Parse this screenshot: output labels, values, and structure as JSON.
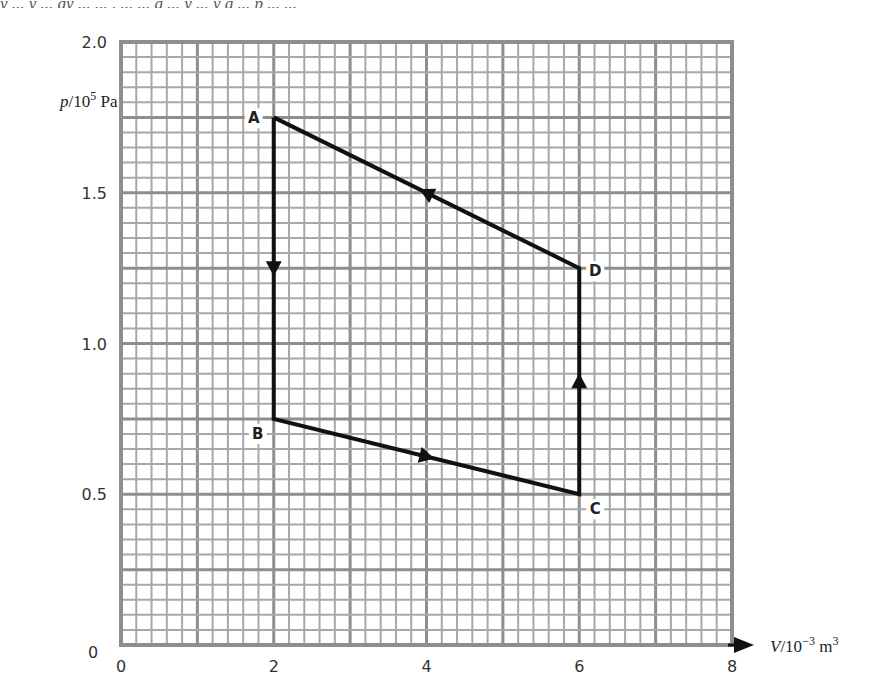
{
  "header": {
    "cutoff_text": "y ... y ... gy ... ... , ... ... g ... y ... y g ... p ... ..."
  },
  "chart_data": {
    "type": "line",
    "title": "",
    "xlabel": "V/10^-3 m^3",
    "ylabel": "p/10^5 Pa",
    "xlim": [
      0,
      8
    ],
    "ylim": [
      0,
      2.0
    ],
    "grid": true,
    "x_ticks": [
      "0",
      "2",
      "4",
      "6",
      "8"
    ],
    "y_ticks": [
      "0",
      "0.5",
      "1.0",
      "1.5",
      "2.0"
    ],
    "points": [
      {
        "label": "A",
        "x": 2,
        "y": 1.75
      },
      {
        "label": "B",
        "x": 2,
        "y": 0.75
      },
      {
        "label": "C",
        "x": 6,
        "y": 0.5
      },
      {
        "label": "D",
        "x": 6,
        "y": 1.25
      }
    ],
    "cycle": [
      "A",
      "B",
      "C",
      "D",
      "A"
    ],
    "direction_arrows": [
      {
        "from": "A",
        "to": "B",
        "at": [
          2,
          1.25
        ]
      },
      {
        "from": "B",
        "to": "C",
        "at": [
          4,
          0.625
        ]
      },
      {
        "from": "C",
        "to": "D",
        "at": [
          6,
          0.875
        ]
      },
      {
        "from": "D",
        "to": "A",
        "at": [
          4,
          1.5
        ]
      }
    ],
    "annotations": [
      "A",
      "B",
      "C",
      "D"
    ]
  },
  "labels": {
    "ylabel_main": "p",
    "ylabel_rest": "/10",
    "ylabel_exp": "5",
    "ylabel_unit": " Pa",
    "xlabel_main": "V",
    "xlabel_rest": "/10",
    "xlabel_exp": "−3",
    "xlabel_unit": " m",
    "xlabel_unit_exp": "3",
    "y_zero_label": "0"
  },
  "colors": {
    "grid": "#a8a8a8",
    "grid_major": "#8e8e8e",
    "line": "#111111",
    "text": "#333333"
  }
}
